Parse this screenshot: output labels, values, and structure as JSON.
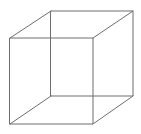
{
  "figure": {
    "type": "line-drawing",
    "canvas": {
      "width": 141,
      "height": 134,
      "background_color": "#ffffff"
    },
    "style": {
      "stroke_color": "#6e6e6e",
      "stroke_width": 1,
      "fill": "none",
      "antialiased": true
    },
    "geometry": {
      "projection": "oblique",
      "offset_x": 41,
      "offset_y": -27,
      "front_face": {
        "name": "front-face",
        "points": "10,38 93,38 93,124 10,124",
        "vertices": [
          {
            "name": "front-top-left",
            "x": 10,
            "y": 38
          },
          {
            "name": "front-top-right",
            "x": 93,
            "y": 38
          },
          {
            "name": "front-bottom-right",
            "x": 93,
            "y": 124
          },
          {
            "name": "front-bottom-left",
            "x": 10,
            "y": 124
          }
        ]
      },
      "back_face": {
        "name": "back-face",
        "points": "51,11 133,11 133,96 51,96",
        "vertices": [
          {
            "name": "back-top-left",
            "x": 51,
            "y": 11
          },
          {
            "name": "back-top-right",
            "x": 133,
            "y": 11
          },
          {
            "name": "back-bottom-right",
            "x": 133,
            "y": 96
          },
          {
            "name": "back-bottom-left",
            "x": 51,
            "y": 96
          }
        ]
      },
      "connecting_edges": [
        {
          "name": "edge-top-left",
          "x1": 10,
          "y1": 38,
          "x2": 51,
          "y2": 11
        },
        {
          "name": "edge-top-right",
          "x1": 93,
          "y1": 38,
          "x2": 133,
          "y2": 11
        },
        {
          "name": "edge-bottom-right",
          "x1": 93,
          "y1": 124,
          "x2": 133,
          "y2": 96
        },
        {
          "name": "edge-bottom-left",
          "x1": 10,
          "y1": 124,
          "x2": 51,
          "y2": 96
        }
      ]
    }
  }
}
